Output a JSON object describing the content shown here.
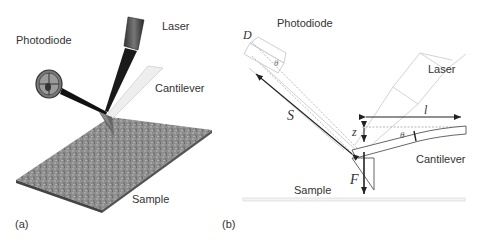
{
  "panel_a": {
    "label": "(a)",
    "labels": {
      "photodiode": "Photodiode",
      "laser": "Laser",
      "cantilever": "Cantilever",
      "sample": "Sample"
    }
  },
  "panel_b": {
    "label": "(b)",
    "labels": {
      "photodiode": "Photodiode",
      "laser": "Laser",
      "cantilever": "Cantilever",
      "sample": "Sample"
    },
    "symbols": {
      "D": "D",
      "S": "S",
      "theta_top": "θ",
      "theta_cantilever": "θ",
      "z": "z",
      "l": "l",
      "F": "F"
    }
  },
  "colors": {
    "ink": "#222222",
    "text": "#333333",
    "light_outline": "#c8c8c8",
    "sample_gray": "#8f8f8f",
    "dark_beam": "#1a1a1a"
  }
}
